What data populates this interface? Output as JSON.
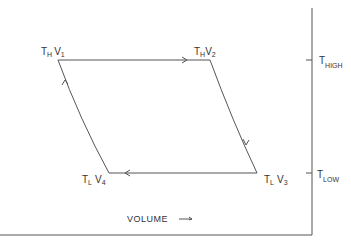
{
  "diagram": {
    "type": "carnot-cycle-temperature-volume",
    "colors": {
      "line": "#555555",
      "text": "#333333",
      "background": "#ffffff"
    },
    "states": [
      {
        "id": "1",
        "T": "H",
        "V": "1",
        "label_T": "T",
        "label_T_sub": "H",
        "label_V": "V",
        "label_V_sub": "1"
      },
      {
        "id": "2",
        "T": "H",
        "V": "2",
        "label_T": "T",
        "label_T_sub": "H",
        "label_V": "V",
        "label_V_sub": "2"
      },
      {
        "id": "3",
        "T": "L",
        "V": "3",
        "label_T": "T",
        "label_T_sub": "L",
        "label_V": "V",
        "label_V_sub": "3"
      },
      {
        "id": "4",
        "T": "L",
        "V": "4",
        "label_T": "T",
        "label_T_sub": "L",
        "label_V": "V",
        "label_V_sub": "4"
      }
    ],
    "processes": [
      {
        "from": "1",
        "to": "2",
        "kind": "isothermal expansion",
        "arrow": "right"
      },
      {
        "from": "2",
        "to": "3",
        "kind": "adiabatic expansion",
        "arrow": "down"
      },
      {
        "from": "3",
        "to": "4",
        "kind": "isothermal compression",
        "arrow": "left"
      },
      {
        "from": "4",
        "to": "1",
        "kind": "adiabatic compression",
        "arrow": "up"
      }
    ],
    "right_axis": {
      "ticks": [
        {
          "label": "T",
          "sub": "HIGH"
        },
        {
          "label": "T",
          "sub": "LOW"
        }
      ]
    },
    "x_axis": {
      "label": "VOLUME",
      "arrow": "→"
    }
  }
}
